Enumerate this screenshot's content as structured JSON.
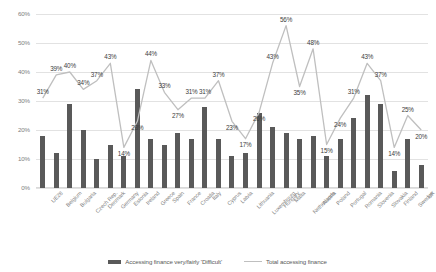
{
  "chart_data": {
    "type": "bar",
    "title": "",
    "xlabel": "",
    "ylabel": "",
    "ylim": [
      0,
      60
    ],
    "ytick_labels": [
      "0%",
      "10%",
      "20%",
      "30%",
      "40%",
      "50%",
      "60%"
    ],
    "ytick_values": [
      0,
      10,
      20,
      30,
      40,
      50,
      60
    ],
    "grid": true,
    "legend_position": "bottom",
    "categories": [
      "UE28",
      "Belgium",
      "Bulgaria",
      "Czech Rep.",
      "Denmark",
      "Germany",
      "Estonia",
      "Ireland",
      "Greece",
      "Spain",
      "France",
      "Croatia",
      "Italy",
      "Cyprus",
      "Latvia",
      "Lithuania",
      "Luxembourg",
      "Hungary",
      "Malta",
      "Netherlands",
      "Austria",
      "Poland",
      "Portugal",
      "Romania",
      "Slovenia",
      "Slovakia",
      "Finland",
      "Sweden",
      "UK"
    ],
    "series": [
      {
        "name": "Accessing finance very/fairly 'Difficult'",
        "type": "bar",
        "color": "#595959",
        "labels_shown": false,
        "values": [
          18,
          12,
          29,
          20,
          10,
          15,
          11,
          34,
          17,
          15,
          19,
          17,
          28,
          17,
          11,
          12,
          26,
          21,
          19,
          17,
          18,
          11,
          17,
          24,
          32,
          29,
          6,
          17,
          8
        ]
      },
      {
        "name": "Total accessing finance",
        "type": "line",
        "color": "#bfbfbf",
        "labels_shown": true,
        "values": [
          31,
          39,
          40,
          34,
          37,
          43,
          14,
          23,
          44,
          33,
          27,
          31,
          31,
          37,
          23,
          17,
          26,
          43,
          56,
          35,
          48,
          15,
          24,
          31,
          43,
          37,
          14,
          25,
          20
        ],
        "value_labels": [
          "31%",
          "39%",
          "40%",
          "34%",
          "37%",
          "43%",
          "14%",
          "23%",
          "44%",
          "33%",
          "27%",
          "31%",
          "31%",
          "37%",
          "23%",
          "17%",
          "26%",
          "43%",
          "56%",
          "35%",
          "48%",
          "15%",
          "24%",
          "31%",
          "43%",
          "37%",
          "14%",
          "25%",
          "20%"
        ]
      }
    ]
  },
  "legend": {
    "items": [
      {
        "label": "Accessing finance very/fairly 'Difficult'",
        "marker": "bar-swatch"
      },
      {
        "label": "Total accessing finance",
        "marker": "line-swatch"
      }
    ]
  }
}
